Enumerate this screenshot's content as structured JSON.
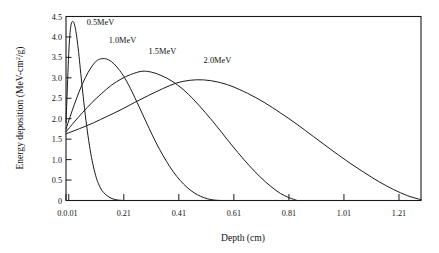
{
  "chart_data": {
    "type": "line",
    "title": "",
    "xlabel": "Depth (cm)",
    "ylabel_parts": {
      "before": "Energy deposition (MeV-cm",
      "sup": "2",
      "after": "/g)"
    },
    "ylabel": "Energy deposition (MeV-cm2/g)",
    "xlim": [
      0.0,
      1.29
    ],
    "ylim": [
      0.0,
      4.5
    ],
    "grid": false,
    "legend_position": "inline-annotations",
    "xticks": [
      0.0,
      0.01,
      0.21,
      0.41,
      0.61,
      0.81,
      1.01,
      1.21
    ],
    "xticklabels": [
      "0.0",
      "0.01",
      "0.21",
      "0.41",
      "0.61",
      "0.81",
      "1.01",
      "1.21"
    ],
    "xticklabels_rendered": [
      "0.0.01",
      "0.21",
      "0.41",
      "0.61",
      "0.81",
      "1.01",
      "1.21"
    ],
    "yticks": [
      0,
      0.5,
      1.0,
      1.5,
      2.0,
      2.5,
      3.0,
      3.5,
      4.0,
      4.5
    ],
    "yticklabels": [
      "0",
      "0.5",
      "1.0",
      "1.5",
      "2.0",
      "2.5",
      "3.0",
      "3.5",
      "4.0",
      "4.5"
    ],
    "series": [
      {
        "name": "0.5MeV",
        "label": "0.5MeV",
        "label_x": 0.075,
        "label_y": 4.28,
        "peak_x": 0.025,
        "peak_y": 4.38,
        "range_x": 0.19,
        "x": [
          0.0,
          0.004,
          0.008,
          0.012,
          0.016,
          0.02,
          0.025,
          0.03,
          0.035,
          0.04,
          0.046,
          0.052,
          0.06,
          0.07,
          0.08,
          0.09,
          0.1,
          0.11,
          0.12,
          0.13,
          0.145,
          0.16,
          0.175,
          0.19,
          0.21
        ],
        "y": [
          1.9,
          2.6,
          3.3,
          3.85,
          4.18,
          4.34,
          4.38,
          4.32,
          4.18,
          3.95,
          3.62,
          3.22,
          2.7,
          2.1,
          1.58,
          1.15,
          0.82,
          0.56,
          0.38,
          0.25,
          0.14,
          0.07,
          0.03,
          0.01,
          0.0
        ]
      },
      {
        "name": "1.0MeV",
        "label": "1.0MeV",
        "label_x": 0.155,
        "label_y": 3.86,
        "peak_x": 0.14,
        "peak_y": 3.47,
        "range_x": 0.52,
        "x": [
          0.0,
          0.015,
          0.03,
          0.05,
          0.07,
          0.09,
          0.11,
          0.125,
          0.14,
          0.155,
          0.175,
          0.195,
          0.215,
          0.24,
          0.265,
          0.29,
          0.315,
          0.34,
          0.365,
          0.39,
          0.415,
          0.44,
          0.465,
          0.49,
          0.515,
          0.54,
          0.56
        ],
        "y": [
          1.75,
          2.05,
          2.34,
          2.7,
          3.0,
          3.24,
          3.41,
          3.46,
          3.47,
          3.44,
          3.34,
          3.18,
          2.98,
          2.66,
          2.3,
          1.94,
          1.58,
          1.25,
          0.96,
          0.7,
          0.49,
          0.32,
          0.19,
          0.1,
          0.04,
          0.01,
          0.0
        ]
      },
      {
        "name": "1.5MeV",
        "label": "1.5MeV",
        "label_x": 0.3,
        "label_y": 3.58,
        "peak_x": 0.275,
        "peak_y": 3.16,
        "range_x": 0.8,
        "x": [
          0.0,
          0.03,
          0.06,
          0.095,
          0.13,
          0.165,
          0.2,
          0.235,
          0.275,
          0.31,
          0.345,
          0.385,
          0.425,
          0.465,
          0.505,
          0.545,
          0.585,
          0.625,
          0.665,
          0.705,
          0.745,
          0.78,
          0.81,
          0.84
        ],
        "y": [
          1.68,
          1.92,
          2.15,
          2.4,
          2.62,
          2.82,
          2.97,
          3.08,
          3.16,
          3.14,
          3.06,
          2.92,
          2.72,
          2.46,
          2.16,
          1.84,
          1.5,
          1.17,
          0.86,
          0.58,
          0.34,
          0.17,
          0.07,
          0.0
        ]
      },
      {
        "name": "2.0MeV",
        "label": "2.0MeV",
        "label_x": 0.5,
        "label_y": 3.36,
        "peak_x": 0.45,
        "peak_y": 2.95,
        "range_x": 1.25,
        "x": [
          0.0,
          0.05,
          0.1,
          0.15,
          0.2,
          0.25,
          0.3,
          0.35,
          0.4,
          0.45,
          0.5,
          0.55,
          0.6,
          0.66,
          0.72,
          0.78,
          0.84,
          0.9,
          0.96,
          1.02,
          1.08,
          1.14,
          1.19,
          1.24,
          1.29
        ],
        "y": [
          1.63,
          1.76,
          1.9,
          2.06,
          2.22,
          2.4,
          2.57,
          2.73,
          2.87,
          2.94,
          2.95,
          2.9,
          2.8,
          2.62,
          2.4,
          2.14,
          1.86,
          1.56,
          1.26,
          0.97,
          0.7,
          0.45,
          0.27,
          0.12,
          0.02
        ]
      }
    ]
  },
  "figure": {
    "background": "#ffffff",
    "ink_color": "#1a1a1a"
  }
}
